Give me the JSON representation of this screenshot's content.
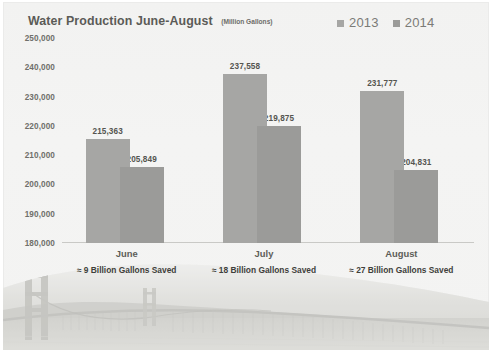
{
  "chart_data": {
    "type": "bar",
    "title": "Water Production June-August",
    "subtitle": "(Million Gallons)",
    "xlabel": "",
    "ylabel": "",
    "categories": [
      "June",
      "July",
      "August"
    ],
    "series": [
      {
        "name": "2013",
        "color": "#a6a6a4",
        "values": [
          215363,
          237558,
          231777
        ],
        "labels": [
          "215,363",
          "237,558",
          "231,777"
        ]
      },
      {
        "name": "2014",
        "color": "#9b9b99",
        "values": [
          205849,
          219875,
          204831
        ],
        "labels": [
          "205,849",
          "219,875",
          "204,831"
        ]
      }
    ],
    "ylim": [
      180000,
      250000
    ],
    "ytick_labels": [
      "250,000",
      "240,000",
      "230,000",
      "220,000",
      "210,000",
      "200,000",
      "190,000",
      "180,000"
    ],
    "ytick_values": [
      250000,
      240000,
      230000,
      220000,
      210000,
      200000,
      190000,
      180000
    ],
    "grid": false,
    "legend_position": "top-right",
    "annotations": [
      "≈ 9 Billion Gallons Saved",
      "≈ 18 Billion Gallons Saved",
      "≈ 27 Billion Gallons Saved"
    ]
  },
  "legend": {
    "items": [
      {
        "label": "2013",
        "color": "#a6a6a4"
      },
      {
        "label": "2014",
        "color": "#9b9b99"
      }
    ]
  },
  "photo": {
    "name": "golden-gate-bridge-photo"
  }
}
